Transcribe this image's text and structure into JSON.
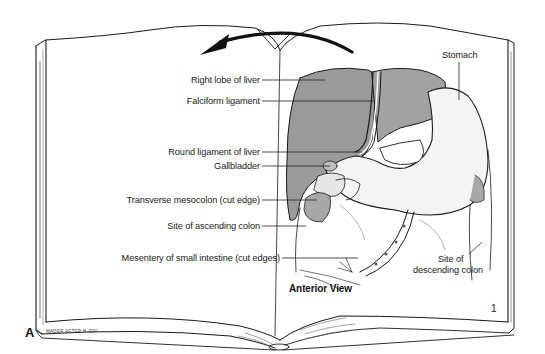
{
  "figure": {
    "panel_letter": "A",
    "view_label": "Anterior View",
    "page_number": "1",
    "credit": "MADER AFTER H.JOY",
    "colors": {
      "liver": "#9a9a9a",
      "stomach": "#f2f2f2",
      "outline": "#1a1a1a",
      "colon_site": "#a8a8a8"
    }
  },
  "labels": {
    "right_lobe_of_liver": "Right lobe of liver",
    "falciform_ligament": "Falciform ligament",
    "round_ligament_of_liver": "Round ligament of liver",
    "gallbladder": "Gallbladder",
    "transverse_mesocolon": "Transverse mesocolon (cut edge)",
    "site_of_ascending_colon": "Site of ascending colon",
    "mesentery_small_intestine": "Mesentery of small intestine (cut edges)",
    "stomach": "Stomach",
    "site_of_descending_colon_1": "Site of",
    "site_of_descending_colon_2": "descending colon"
  }
}
